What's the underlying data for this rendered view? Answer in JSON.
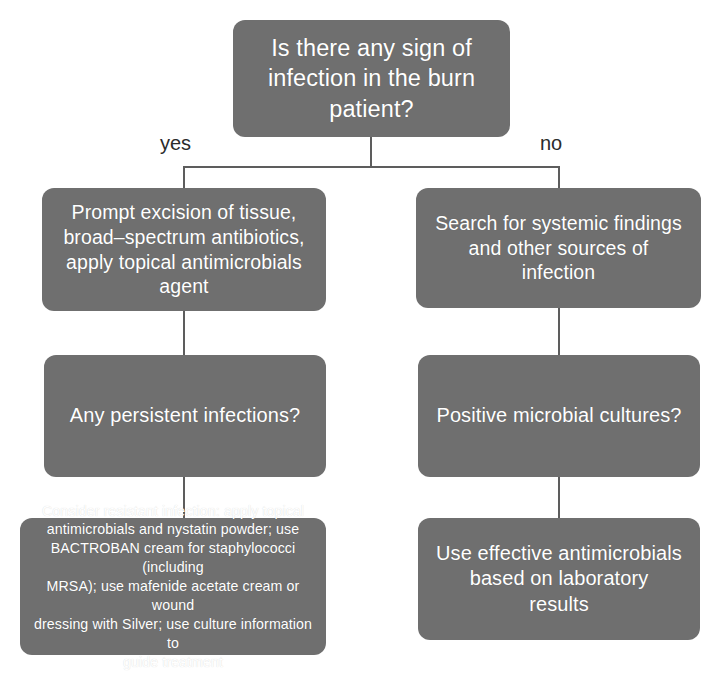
{
  "diagram": {
    "colors": {
      "node_fill": "#6f6f6f",
      "node_text": "#ffffff",
      "connector": "#5d5d5d",
      "background": "#ffffff",
      "label_text": "#2b2b2b"
    },
    "nodes": {
      "root": {
        "id": "root",
        "type": "decision",
        "text": "Is there any sign of\ninfection in the burn\npatient?"
      },
      "yes_1": {
        "id": "yes-branch-action-1",
        "type": "action",
        "text": "Prompt excision of tissue,\nbroad–spectrum antibiotics,\napply topical antimicrobials\nagent"
      },
      "no_1": {
        "id": "no-branch-action-1",
        "type": "action",
        "text": "Search for systemic findings\nand other sources of\ninfection"
      },
      "yes_2": {
        "id": "yes-branch-decision-2",
        "type": "decision",
        "text": "Any persistent infections?"
      },
      "no_2": {
        "id": "no-branch-decision-2",
        "type": "decision",
        "text": "Positive microbial cultures?"
      },
      "yes_3": {
        "id": "yes-branch-action-3",
        "type": "action",
        "text": "Consider resistant infection: apply topical\nantimicrobials and nystatin powder; use\nBACTROBAN cream for staphylococci (including\nMRSA); use mafenide acetate cream or wound\ndressing with Silver; use culture information  to\nguide treatment"
      },
      "no_3": {
        "id": "no-branch-action-3",
        "type": "action",
        "text": "Use effective antimicrobials\nbased on laboratory\nresults"
      }
    },
    "edge_labels": {
      "yes": "yes",
      "no": "no"
    }
  }
}
